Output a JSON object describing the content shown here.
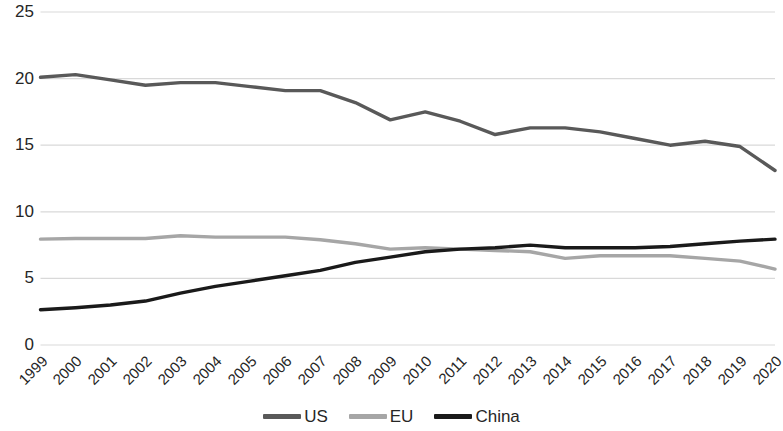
{
  "chart_data": {
    "type": "line",
    "title": "",
    "subtitle": "",
    "xlabel": "",
    "ylabel": "",
    "grid": true,
    "legend_position": "bottom",
    "xlim": [
      1999,
      2020
    ],
    "ylim": [
      0,
      25
    ],
    "ytick_labels": [
      "25",
      "20",
      "15",
      "10",
      "5",
      "0"
    ],
    "ytick_values": [
      25,
      20,
      15,
      10,
      5,
      0
    ],
    "categories": [
      "1999",
      "2000",
      "2001",
      "2002",
      "2003",
      "2004",
      "2005",
      "2006",
      "2007",
      "2008",
      "2009",
      "2010",
      "2011",
      "2012",
      "2013",
      "2014",
      "2015",
      "2016",
      "2017",
      "2018",
      "2019",
      "2020"
    ],
    "series": [
      {
        "name": "US",
        "color": "#595959",
        "values": [
          20.1,
          20.3,
          19.9,
          19.5,
          19.7,
          19.7,
          19.4,
          19.1,
          19.1,
          18.2,
          16.9,
          17.5,
          16.8,
          15.8,
          16.3,
          16.3,
          16.0,
          15.5,
          15.0,
          15.3,
          14.9,
          13.1
        ]
      },
      {
        "name": "EU",
        "color": "#a6a6a6",
        "values": [
          7.95,
          8.0,
          8.0,
          8.0,
          8.2,
          8.1,
          8.1,
          8.1,
          7.9,
          7.6,
          7.2,
          7.3,
          7.2,
          7.1,
          7.0,
          6.5,
          6.7,
          6.7,
          6.7,
          6.5,
          6.3,
          5.7
        ]
      },
      {
        "name": "China",
        "color": "#1a1a1a",
        "values": [
          2.65,
          2.8,
          3.0,
          3.3,
          3.9,
          4.4,
          4.8,
          5.2,
          5.6,
          6.2,
          6.6,
          7.0,
          7.2,
          7.3,
          7.5,
          7.3,
          7.3,
          7.3,
          7.4,
          7.6,
          7.8,
          7.95
        ]
      }
    ],
    "legend": [
      {
        "label": "US",
        "color": "#595959"
      },
      {
        "label": "EU",
        "color": "#a6a6a6"
      },
      {
        "label": "China",
        "color": "#1a1a1a"
      }
    ],
    "axis": {
      "grid_color": "#d9d9d9",
      "text_color": "#262626"
    }
  }
}
